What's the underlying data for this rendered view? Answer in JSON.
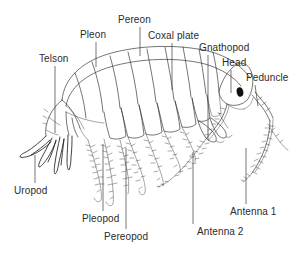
{
  "figure": {
    "background_color": "#ffffff",
    "line_color": "#3a3a3a",
    "text_color": "#2b2b2b",
    "eye_color": "#101010"
  },
  "labels": [
    {
      "id": "pereon",
      "text": "Pereon",
      "x": 118,
      "y": 14,
      "leader": {
        "x1": 140,
        "y1": 27,
        "x2": 140,
        "y2": 56
      }
    },
    {
      "id": "coxal_plate",
      "text": "Coxal plate",
      "x": 148,
      "y": 30,
      "leader": {
        "x1": 172,
        "y1": 43,
        "x2": 172,
        "y2": 90
      }
    },
    {
      "id": "pleon",
      "text": "Pleon",
      "x": 80,
      "y": 29,
      "leader": {
        "x1": 96,
        "y1": 42,
        "x2": 96,
        "y2": 67
      }
    },
    {
      "id": "gnathopod",
      "text": "Gnathopod",
      "x": 199,
      "y": 42,
      "leader": {
        "x1": 208,
        "y1": 55,
        "x2": 208,
        "y2": 140
      }
    },
    {
      "id": "telson",
      "text": "Telson",
      "x": 39,
      "y": 53,
      "leader": {
        "x1": 55,
        "y1": 66,
        "x2": 55,
        "y2": 133
      }
    },
    {
      "id": "head",
      "text": "Head",
      "x": 222,
      "y": 57,
      "leader": {
        "x1": 231,
        "y1": 70,
        "x2": 231,
        "y2": 93
      }
    },
    {
      "id": "peduncle",
      "text": "Peduncle",
      "x": 246,
      "y": 72,
      "leader": {
        "x1": 255,
        "y1": 85,
        "x2": 258,
        "y2": 106
      }
    },
    {
      "id": "uropod",
      "text": "Uropod",
      "x": 14,
      "y": 185,
      "leader": {
        "x1": 35,
        "y1": 183,
        "x2": 35,
        "y2": 155
      }
    },
    {
      "id": "pleopod",
      "text": "Pleopod",
      "x": 82,
      "y": 213,
      "leader": {
        "x1": 103,
        "y1": 211,
        "x2": 103,
        "y2": 144
      }
    },
    {
      "id": "pereopod",
      "text": "Pereopod",
      "x": 104,
      "y": 231,
      "leader": {
        "x1": 126,
        "y1": 229,
        "x2": 126,
        "y2": 148
      }
    },
    {
      "id": "antenna_2",
      "text": "Antenna 2",
      "x": 197,
      "y": 226,
      "leader": {
        "x1": 193,
        "y1": 224,
        "x2": 193,
        "y2": 152
      }
    },
    {
      "id": "antenna_1",
      "text": "Antenna 1",
      "x": 230,
      "y": 206,
      "leader": {
        "x1": 246,
        "y1": 204,
        "x2": 246,
        "y2": 148
      }
    }
  ],
  "anatomy_parts": [
    "dorsal-body-arch",
    "pleon-segments",
    "pereon-segments",
    "coxal-plates",
    "head-capsule",
    "eye",
    "antenna-1",
    "antenna-2",
    "peduncle",
    "gnathopods",
    "pereopods",
    "pleopods",
    "uropods",
    "telson"
  ]
}
